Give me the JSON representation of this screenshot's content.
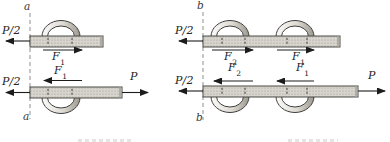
{
  "figure": {
    "left": {
      "section_top": "a",
      "section_bottom": "a",
      "top_plate": {
        "applied_left": "P/2",
        "shear": {
          "base": "F",
          "sub": "1"
        }
      },
      "bottom_plate": {
        "applied_left": "P/2",
        "shear": {
          "base": "F",
          "sub": "1"
        },
        "applied_right": "P"
      }
    },
    "right": {
      "section_top": "b",
      "section_bottom": "b",
      "top_plate": {
        "applied_left": "P/2",
        "shear_left": {
          "base": "F",
          "sub": "2"
        },
        "shear_right": {
          "base": "F",
          "sub": "1"
        }
      },
      "bottom_plate": {
        "applied_left": "P/2",
        "shear_left": {
          "base": "F",
          "sub": "2"
        },
        "shear_right": {
          "base": "F",
          "sub": "1"
        },
        "applied_right": "P"
      }
    },
    "colors": {
      "background": "#ffffff",
      "plate_fill": "#d8d5ce",
      "plate_stipple": "#97938a",
      "plate_border": "#4a4a48",
      "plate_end_shade": "#b0ada6",
      "arrow": "#1c1c1c",
      "section_line": "#8f8f8f",
      "tick_line": "#3c3c3c",
      "arc_outline": "#3f3f3f",
      "arc_shade_dark": "#9d998f",
      "arc_shade_light": "#fbfaf8"
    }
  }
}
